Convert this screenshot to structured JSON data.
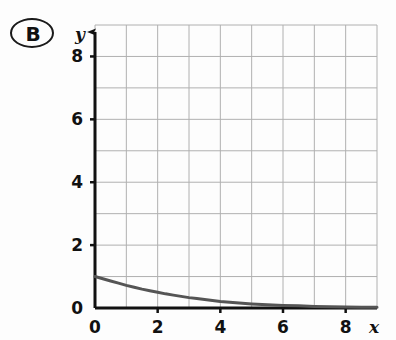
{
  "figure": {
    "item_label": "B",
    "badge_shape": "oval"
  },
  "chart_data": {
    "type": "line",
    "title": "",
    "subtitle": "",
    "xlabel": "x",
    "ylabel": "y",
    "xlim": [
      0,
      9
    ],
    "ylim": [
      0,
      9
    ],
    "grid": true,
    "grid_step": 1,
    "legend": null,
    "x_ticks": [
      0,
      2,
      4,
      6,
      8
    ],
    "y_ticks": [
      0,
      2,
      4,
      6,
      8
    ],
    "x_tick_labels": [
      "0",
      "2",
      "4",
      "6",
      "8"
    ],
    "y_tick_labels": [
      "0",
      "2",
      "4",
      "6",
      "8"
    ],
    "axis_arrows": true,
    "series": [
      {
        "name": "exponential decay",
        "color": "#555555",
        "line_width": 3,
        "description": "decreasing exponential curve starting at (0, 1) approaching y = 0",
        "x": [
          0,
          0.25,
          0.5,
          0.75,
          1,
          1.25,
          1.5,
          1.75,
          2,
          2.25,
          2.5,
          2.75,
          3,
          3.25,
          3.5,
          3.75,
          4,
          4.5,
          5,
          5.5,
          6,
          6.5,
          7,
          7.5,
          8,
          8.5,
          9
        ],
        "y": [
          1.0,
          0.93,
          0.86,
          0.79,
          0.72,
          0.66,
          0.6,
          0.55,
          0.5,
          0.45,
          0.41,
          0.37,
          0.33,
          0.3,
          0.27,
          0.24,
          0.21,
          0.17,
          0.13,
          0.1,
          0.08,
          0.07,
          0.05,
          0.04,
          0.03,
          0.02,
          0.02
        ]
      }
    ],
    "annotations": [],
    "colors": {
      "curve": "#555555",
      "grid": "#b0b0b0",
      "axis": "#111111",
      "background": "#fdfdfd"
    }
  }
}
